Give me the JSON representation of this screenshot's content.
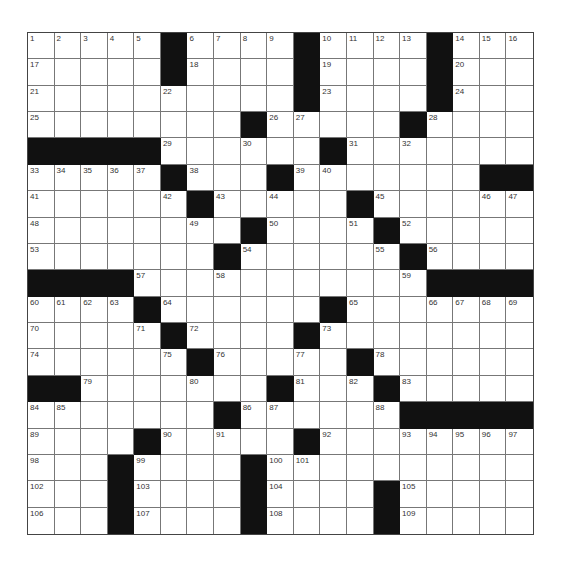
{
  "puzzle": {
    "rows": 19,
    "cols": 19,
    "colors": {
      "block": "#111111",
      "cell": "#ffffff",
      "line": "#777777",
      "number": "#333333"
    },
    "grid": [
      [
        "1",
        "2",
        "3",
        "4",
        "5",
        "#",
        "6",
        "7",
        "8",
        "9",
        "#",
        "10",
        "11",
        "12",
        "13",
        "#",
        "14",
        "15",
        "16"
      ],
      [
        "17",
        "",
        "",
        "",
        "",
        "#",
        "18",
        "",
        "",
        "",
        "#",
        "19",
        "",
        "",
        "",
        "#",
        "20",
        "",
        ""
      ],
      [
        "21",
        "",
        "",
        "",
        "",
        "22",
        "",
        "",
        "",
        "",
        "#",
        "23",
        "",
        "",
        "",
        "#",
        "24",
        "",
        ""
      ],
      [
        "25",
        "",
        "",
        "",
        "",
        "",
        "",
        "",
        "#",
        "26",
        "27",
        "",
        "",
        "",
        "#",
        "28",
        "",
        "",
        ""
      ],
      [
        "#",
        "#",
        "#",
        "#",
        "#",
        "29",
        "",
        "",
        "30",
        "",
        "",
        "#",
        "31",
        "",
        "32",
        "",
        "",
        "",
        ""
      ],
      [
        "33",
        "34",
        "35",
        "36",
        "37",
        "#",
        "38",
        "",
        "",
        "#",
        "39",
        "40",
        "",
        "",
        "",
        "",
        "",
        "#",
        "#"
      ],
      [
        "41",
        "",
        "",
        "",
        "",
        "42",
        "#",
        "43",
        "",
        "44",
        "",
        "",
        "#",
        "45",
        "",
        "",
        "",
        "46",
        "47"
      ],
      [
        "48",
        "",
        "",
        "",
        "",
        "",
        "49",
        "",
        "#",
        "50",
        "",
        "",
        "51",
        "#",
        "52",
        "",
        "",
        "",
        ""
      ],
      [
        "53",
        "",
        "",
        "",
        "",
        "",
        "",
        "#",
        "54",
        "",
        "",
        "",
        "",
        "55",
        "#",
        "56",
        "",
        "",
        ""
      ],
      [
        "#",
        "#",
        "#",
        "#",
        "57",
        "",
        "",
        "58",
        "",
        "",
        "",
        "",
        "",
        "",
        "59",
        "#",
        "#",
        "#",
        "#"
      ],
      [
        "60",
        "61",
        "62",
        "63",
        "#",
        "64",
        "",
        "",
        "",
        "",
        "",
        "#",
        "65",
        "",
        "",
        "66",
        "67",
        "68",
        "69"
      ],
      [
        "70",
        "",
        "",
        "",
        "71",
        "#",
        "72",
        "",
        "",
        "",
        "#",
        "73",
        "",
        "",
        "",
        "",
        "",
        "",
        ""
      ],
      [
        "74",
        "",
        "",
        "",
        "",
        "75",
        "#",
        "76",
        "",
        "",
        "77",
        "",
        "#",
        "78",
        "",
        "",
        "",
        "",
        ""
      ],
      [
        "#",
        "#",
        "79",
        "",
        "",
        "",
        "80",
        "",
        "",
        "#",
        "81",
        "",
        "82",
        "#",
        "83",
        "",
        "",
        "",
        ""
      ],
      [
        "84",
        "85",
        "",
        "",
        "",
        "",
        "",
        "#",
        "86",
        "87",
        "",
        "",
        "",
        "88",
        "#",
        "#",
        "#",
        "#",
        "#"
      ],
      [
        "89",
        "",
        "",
        "",
        "#",
        "90",
        "",
        "91",
        "",
        "",
        "#",
        "92",
        "",
        "",
        "93",
        "94",
        "95",
        "96",
        "97"
      ],
      [
        "98",
        "",
        "",
        "#",
        "99",
        "",
        "",
        "",
        "#",
        "100",
        "101",
        "",
        "",
        "",
        "",
        "",
        "",
        "",
        ""
      ],
      [
        "102",
        "",
        "",
        "#",
        "103",
        "",
        "",
        "",
        "#",
        "104",
        "",
        "",
        "",
        "#",
        "105",
        "",
        "",
        "",
        ""
      ],
      [
        "106",
        "",
        "",
        "#",
        "107",
        "",
        "",
        "",
        "#",
        "108",
        "",
        "",
        "",
        "#",
        "109",
        "",
        "",
        "",
        ""
      ]
    ]
  }
}
